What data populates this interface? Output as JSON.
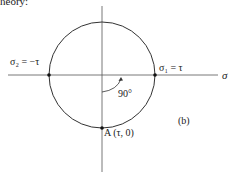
{
  "header_fragment": "theory:",
  "diagram": {
    "panel_label": "(b)",
    "axis_label": "σ",
    "left_point_label": "σ₂ = −τ",
    "right_point_label": "σ₁ = τ",
    "bottom_point_label": "A (τ, 0)",
    "angle_label": "90°",
    "colors": {
      "line": "#333333",
      "axis": "#555555"
    }
  }
}
